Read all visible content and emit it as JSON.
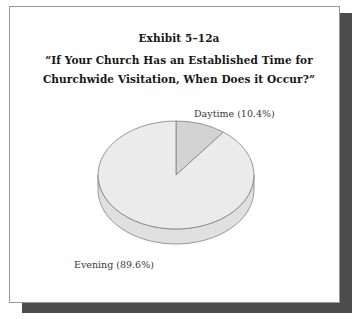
{
  "figure": {
    "exhibit_number": "Exhibit 5–12a",
    "question_line_1": "“If Your Church Has an Established Time for",
    "question_line_2": "Churchwide Visitation, When Does it Occur?”"
  },
  "labels": {
    "daytime": "Daytime (10.4%)",
    "evening": "Evening (89.6%)"
  },
  "colors": {
    "daytime_slice": "#d3d3d3",
    "evening_slice": "#ebebeb",
    "daytime_side": "#c2c2c2",
    "evening_side": "#e0e0e0",
    "outline": "#808080",
    "frame_border": "#9a9a9a",
    "shadow": "#4c4c4c",
    "title_text": "#171717",
    "label_text": "#3a3a3a",
    "background": "#ffffff"
  },
  "chart_data": {
    "type": "pie",
    "title": "“If Your Church Has an Established Time for Churchwide Visitation, When Does it Occur?”",
    "subtitle": "Exhibit 5–12a",
    "three_d": true,
    "start_angle_deg": 0,
    "direction": "clockwise",
    "categories": [
      "Daytime",
      "Evening"
    ],
    "values": [
      10.4,
      89.6
    ],
    "value_unit": "percent",
    "labels": [
      "Daytime (10.4%)",
      "Evening (89.6%)"
    ],
    "colors": [
      "#d3d3d3",
      "#ebebeb"
    ],
    "legend": false,
    "grid": false,
    "xlabel": "",
    "ylabel": ""
  }
}
